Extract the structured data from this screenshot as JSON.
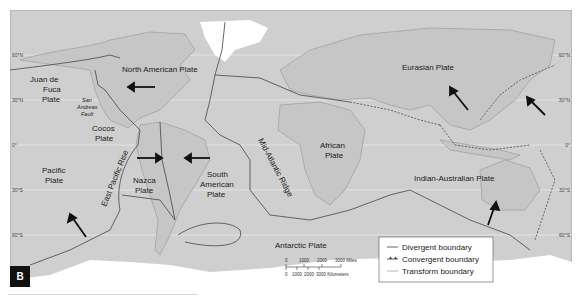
{
  "figure": {
    "panel_label": "B",
    "colors": {
      "ocean": "#cfcfcf",
      "land": "#c9c9c9",
      "ice": "#ffffff",
      "boundary": "#555555",
      "coast": "#8a8a8a",
      "arrow": "#111111",
      "gridline": "#ececec",
      "panel_badge": "#111111"
    }
  },
  "latitudes_left": [
    "60°N",
    "30°N",
    "0°",
    "30°S",
    "60°S"
  ],
  "latitudes_right": [
    "60°N",
    "30°N",
    "0°",
    "30°S",
    "60°S"
  ],
  "plates": {
    "north_american": "North American Plate",
    "eurasian": "Eurasian Plate",
    "juan_de_fuca_1": "Juan de",
    "juan_de_fuca_2": "Fuca",
    "juan_de_fuca_3": "Plate",
    "san_andreas_1": "San",
    "san_andreas_2": "Andreas",
    "san_andreas_3": "Fault",
    "cocos_1": "Cocos",
    "cocos_2": "Plate",
    "pacific_1": "Pacific",
    "pacific_2": "Plate",
    "east_pacific_rise": "East Pacific Rise",
    "nazca_1": "Nazca",
    "nazca_2": "Plate",
    "south_american_1": "South",
    "south_american_2": "American",
    "south_american_3": "Plate",
    "mid_atlantic_ridge": "Mid-Atlantic Ridge",
    "african_1": "African",
    "african_2": "Plate",
    "indian_australian": "Indian-Australian Plate",
    "antarctic": "Antarctic Plate"
  },
  "legend": {
    "items": [
      {
        "symbol": "divergent-line",
        "label": "Divergent boundary"
      },
      {
        "symbol": "convergent-line",
        "label": "Convergent boundary"
      },
      {
        "symbol": "transform-line",
        "label": "Transform boundary"
      }
    ]
  },
  "scale_bar": {
    "miles_ticks": [
      "0",
      "1000",
      "2000",
      "3000 Miles"
    ],
    "km_ticks": [
      "0",
      "1000",
      "2000",
      "3000 Kilometers"
    ]
  }
}
